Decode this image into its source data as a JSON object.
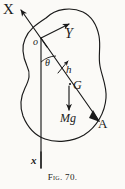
{
  "figure": {
    "caption": "Fig. 70.",
    "kind": "rigid-body-pendulum-diagram",
    "background_color": "#fbfaf7",
    "ink_color": "#1a1a1a",
    "labels": {
      "axis_x_upper": "X",
      "axis_y": "Y",
      "origin": "o",
      "angle": "θ",
      "distance": "h",
      "center_of_gravity": "G",
      "weight_force": "Mg",
      "point_a": "A",
      "axis_x_lower": "x"
    },
    "elements": {
      "body_outline": "irregular-closed-blob",
      "vertical_line": "o-to-x vertical reference line",
      "slanted_line": "o-to-A line through G",
      "arrow_x": "arrow from origin up-left to X",
      "arrow_y": "arrow from origin up-right to Y",
      "arrow_h": "short arrow along O-A direction labelled h",
      "arrow_mg": "downward arrow from G labelled Mg",
      "arrow_a": "arrowhead at A"
    }
  }
}
